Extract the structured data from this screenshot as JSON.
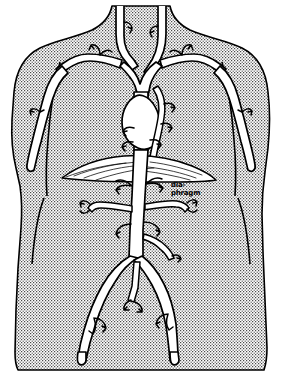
{
  "figure": {
    "caption_label": "",
    "style": "hand-drawn ink line illustration with stippled halftone body fill",
    "colors": {
      "ink": "#000000",
      "paper": "#ffffff",
      "body_tone": "#9a9a9a",
      "vessel_fill": "#ffffff"
    }
  },
  "labels": [
    {
      "id": "diaphragm",
      "line1": "dia-",
      "line2": "phragm",
      "x": 171,
      "y": 186
    }
  ],
  "anatomy": {
    "body_region": "anterior trunk, shoulders to upper thighs",
    "structures": [
      "internal jugular vein (right)",
      "internal jugular vein (left)",
      "subclavian vein (right)",
      "subclavian vein (left)",
      "brachiocephalic vein",
      "superior vena cava",
      "axillary vein (right)",
      "axillary vein (left)",
      "basilic vein (right arm)",
      "basilic vein (left arm)",
      "azygos vein",
      "heart silhouette",
      "diaphragm",
      "inferior vena cava",
      "hepatic veins",
      "renal vein (right)",
      "renal vein (left)",
      "lumbar veins",
      "common iliac vein (right)",
      "common iliac vein (left)",
      "internal iliac vein",
      "femoral vein (right)",
      "femoral vein (left)"
    ]
  }
}
